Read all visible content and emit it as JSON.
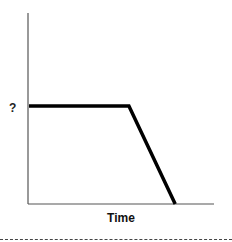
{
  "chart_data": {
    "type": "line",
    "title": "",
    "xlabel": "Time",
    "ylabel": "?",
    "x_ticks": [],
    "y_ticks": [
      "?"
    ],
    "grid": false,
    "legend": null,
    "series": [
      {
        "name": "quantity",
        "color": "#000000",
        "points": [
          {
            "x": 0,
            "y": 1.0
          },
          {
            "x": 0.54,
            "y": 1.0
          },
          {
            "x": 0.79,
            "y": 0.0
          }
        ]
      }
    ],
    "xlim": [
      0,
      1
    ],
    "ylim": [
      0,
      2
    ],
    "annotations": [
      {
        "text": "?",
        "position": "y-axis at plateau level"
      }
    ]
  },
  "labels": {
    "y_axis": "?",
    "x_axis": "Time"
  },
  "colors": {
    "axis": "#555555",
    "line": "#000000",
    "divider": "#444444"
  }
}
